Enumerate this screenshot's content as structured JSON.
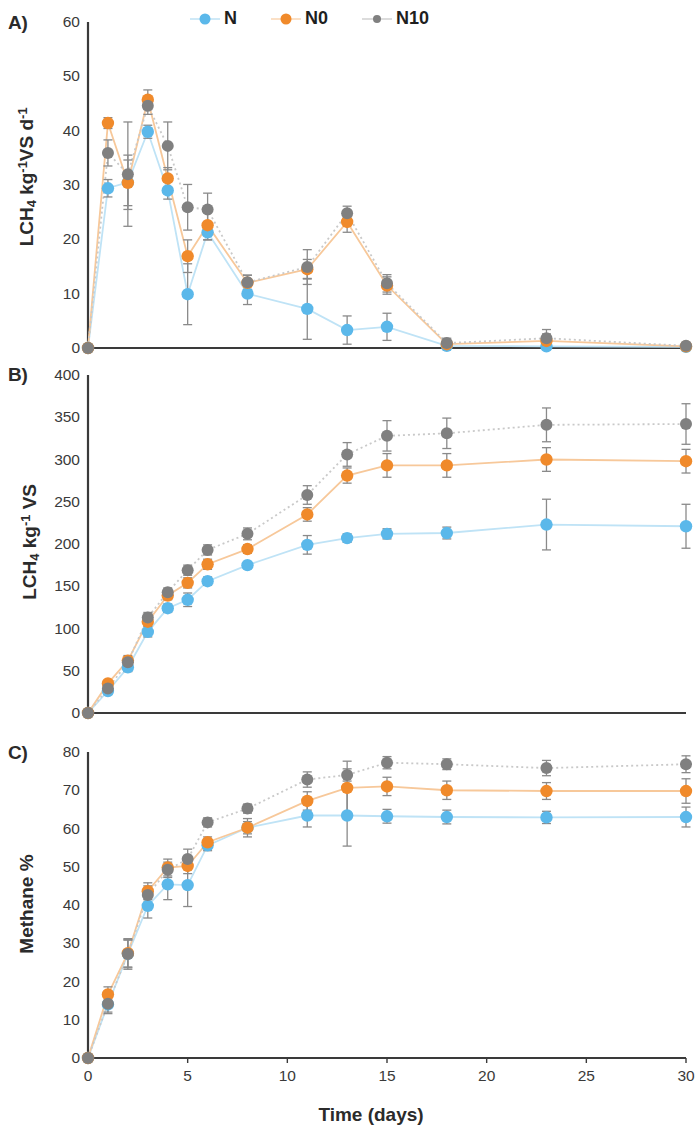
{
  "figure": {
    "width": 694,
    "height": 1137,
    "background": "#ffffff"
  },
  "legend": {
    "position": "top-center",
    "items": [
      {
        "label": "N",
        "color": "#5BB8EA",
        "marker": "circle",
        "line": "solid"
      },
      {
        "label": "N0",
        "color": "#F08A2B",
        "marker": "circle",
        "line": "solid"
      },
      {
        "label": "N10",
        "color": "#808080",
        "marker": "circle",
        "line": "dotted"
      }
    ]
  },
  "colors": {
    "N": "#5BB8EA",
    "N0": "#F08A2B",
    "N10": "#808080",
    "axis": "#3a3a3a",
    "errorbar": "#8a8a8a",
    "text": "#2b2b2b"
  },
  "axis_titles": {
    "x": "Time (days)",
    "panel_a_y_parts": [
      "LCH",
      "4",
      " kg",
      "-1",
      "VS d",
      "-1"
    ],
    "panel_b_y_parts": [
      "LCH",
      "4",
      " kg",
      "-1",
      " VS"
    ],
    "panel_c_y": "Methane %"
  },
  "panels": [
    {
      "key": "A",
      "label": "A)"
    },
    {
      "key": "B",
      "label": "B)"
    },
    {
      "key": "C",
      "label": "C)"
    }
  ],
  "xticks": [
    "0",
    "5",
    "10",
    "15",
    "20",
    "25",
    "30"
  ],
  "panel_a_yticks": [
    "0",
    "10",
    "20",
    "30",
    "40",
    "50",
    "60"
  ],
  "panel_b_yticks": [
    "0",
    "50",
    "100",
    "150",
    "200",
    "250",
    "300",
    "350",
    "400"
  ],
  "panel_c_yticks": [
    "0",
    "10",
    "20",
    "30",
    "40",
    "50",
    "60",
    "70",
    "80"
  ],
  "chart_data": [
    {
      "type": "line",
      "panel": "A",
      "title": "A)",
      "xlabel": "Time (days)",
      "ylabel": "LCH4 kg-1 VS d-1",
      "xlim": [
        0,
        30
      ],
      "ylim": [
        0,
        60
      ],
      "xticks": [
        0,
        5,
        10,
        15,
        20,
        25,
        30
      ],
      "yticks": [
        0,
        10,
        20,
        30,
        40,
        50,
        60
      ],
      "grid": false,
      "legend_position": "top-center",
      "x": [
        0,
        1,
        2,
        3,
        4,
        5,
        6,
        8,
        11,
        13,
        15,
        18,
        23,
        30
      ],
      "series": [
        {
          "name": "N",
          "color": "#5BB8EA",
          "values": [
            0,
            29.4,
            30.5,
            39.8,
            29.0,
            9.9,
            21.3,
            10.0,
            7.2,
            3.3,
            3.9,
            0.4,
            0.3,
            0.2
          ],
          "errors": [
            0,
            1.6,
            5.0,
            1.2,
            1.6,
            5.6,
            1.4,
            2.0,
            5.6,
            2.6,
            2.5,
            0.4,
            0.3,
            0.2
          ]
        },
        {
          "name": "N0",
          "color": "#F08A2B",
          "values": [
            0,
            41.4,
            30.4,
            45.7,
            31.2,
            16.9,
            22.6,
            12.0,
            14.5,
            23.2,
            11.5,
            0.7,
            1.3,
            0.3
          ],
          "errors": [
            0,
            1.0,
            4.2,
            1.8,
            2.0,
            3.0,
            2.7,
            1.4,
            1.8,
            1.9,
            1.6,
            0.6,
            1.3,
            0.3
          ]
        },
        {
          "name": "N10",
          "color": "#808080",
          "values": [
            0,
            35.9,
            32.0,
            44.6,
            37.2,
            25.9,
            25.5,
            12.1,
            14.9,
            24.8,
            11.9,
            0.9,
            1.8,
            0.4
          ],
          "errors": [
            0,
            2.4,
            9.6,
            1.6,
            4.4,
            4.2,
            3.0,
            1.3,
            3.2,
            1.3,
            1.6,
            0.9,
            1.6,
            0.4
          ]
        }
      ]
    },
    {
      "type": "line",
      "panel": "B",
      "title": "B)",
      "xlabel": "Time (days)",
      "ylabel": "LCH4 kg-1 VS",
      "xlim": [
        0,
        30
      ],
      "ylim": [
        0,
        400
      ],
      "xticks": [
        0,
        5,
        10,
        15,
        20,
        25,
        30
      ],
      "yticks": [
        0,
        50,
        100,
        150,
        200,
        250,
        300,
        350,
        400
      ],
      "grid": false,
      "legend_position": "top-center",
      "x": [
        0,
        1,
        2,
        3,
        4,
        5,
        6,
        8,
        11,
        13,
        15,
        18,
        23,
        30
      ],
      "series": [
        {
          "name": "N",
          "color": "#5BB8EA",
          "values": [
            0,
            26,
            54,
            96,
            124,
            134,
            156,
            175,
            199,
            207,
            212,
            213,
            223,
            221
          ],
          "errors": [
            0,
            4,
            5,
            6,
            5,
            8,
            5,
            4,
            11,
            5,
            6,
            7,
            30,
            26
          ]
        },
        {
          "name": "N0",
          "color": "#F08A2B",
          "values": [
            0,
            35,
            62,
            108,
            139,
            154,
            176,
            194,
            235,
            281,
            293,
            293,
            300,
            298
          ],
          "errors": [
            0,
            3,
            6,
            5,
            5,
            6,
            6,
            5,
            8,
            9,
            14,
            14,
            14,
            14
          ]
        },
        {
          "name": "N10",
          "color": "#808080",
          "values": [
            0,
            29,
            60,
            113,
            143,
            169,
            193,
            212,
            258,
            306,
            328,
            331,
            341,
            342
          ],
          "errors": [
            0,
            4,
            6,
            6,
            5,
            6,
            6,
            7,
            11,
            14,
            18,
            18,
            20,
            24
          ]
        }
      ]
    },
    {
      "type": "line",
      "panel": "C",
      "title": "C)",
      "xlabel": "Time (days)",
      "ylabel": "Methane %",
      "xlim": [
        0,
        30
      ],
      "ylim": [
        0,
        80
      ],
      "xticks": [
        0,
        5,
        10,
        15,
        20,
        25,
        30
      ],
      "yticks": [
        0,
        10,
        20,
        30,
        40,
        50,
        60,
        70,
        80
      ],
      "grid": false,
      "legend_position": "top-center",
      "x": [
        0,
        1,
        2,
        3,
        4,
        5,
        6,
        8,
        11,
        13,
        15,
        18,
        23,
        30
      ],
      "series": [
        {
          "name": "N",
          "color": "#5BB8EA",
          "values": [
            0,
            14.0,
            27.2,
            39.8,
            45.4,
            45.2,
            55.6,
            60.2,
            63.4,
            63.4,
            63.2,
            63.0,
            62.9,
            63.0
          ],
          "errors": [
            0,
            2.4,
            3.6,
            3.2,
            4.0,
            5.6,
            1.4,
            1.6,
            3.0,
            8.0,
            1.8,
            1.8,
            1.6,
            2.6
          ]
        },
        {
          "name": "N0",
          "color": "#F08A2B",
          "values": [
            0,
            16.6,
            27.4,
            43.6,
            49.8,
            50.2,
            56.4,
            60.2,
            67.2,
            70.6,
            71.0,
            70.0,
            69.8,
            69.8
          ],
          "errors": [
            0,
            2.0,
            3.6,
            2.2,
            2.2,
            2.0,
            1.4,
            2.4,
            2.4,
            7.0,
            2.4,
            2.4,
            2.2,
            3.2
          ]
        },
        {
          "name": "N10",
          "color": "#808080",
          "values": [
            0,
            14.2,
            27.2,
            42.6,
            49.2,
            52.0,
            61.6,
            65.2,
            72.8,
            74.0,
            77.2,
            76.8,
            75.8,
            76.8
          ],
          "errors": [
            0,
            2.2,
            4.0,
            2.4,
            2.0,
            2.6,
            1.2,
            1.2,
            2.0,
            1.6,
            1.6,
            1.4,
            2.0,
            2.2
          ]
        }
      ]
    }
  ]
}
